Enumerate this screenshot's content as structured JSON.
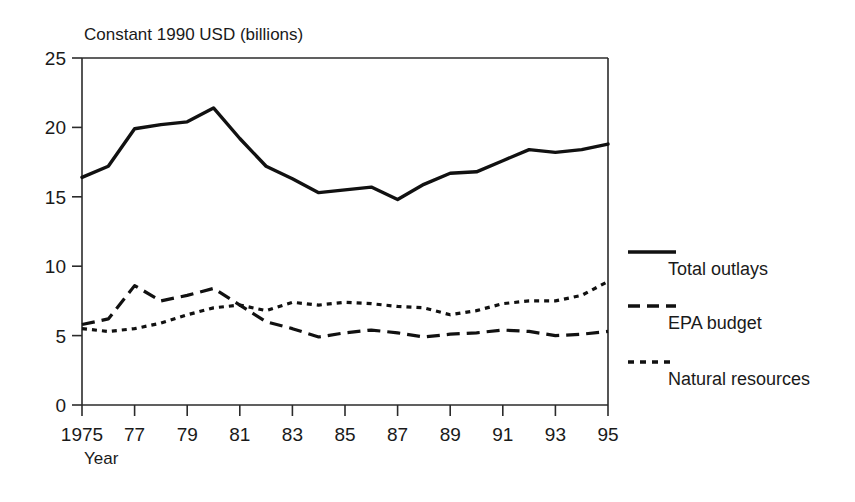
{
  "chart_data": {
    "type": "line",
    "title": "",
    "ylabel": "Constant 1990 USD (billions)",
    "xlabel": "Year",
    "xlim": [
      1975,
      1995
    ],
    "ylim": [
      0,
      25
    ],
    "yticks": [
      "0",
      "5",
      "10",
      "15",
      "20",
      "25"
    ],
    "ytick_values": [
      0,
      5,
      10,
      15,
      20,
      25
    ],
    "xticks": [
      "1975",
      "77",
      "79",
      "81",
      "83",
      "85",
      "87",
      "89",
      "91",
      "93",
      "95"
    ],
    "xtick_values": [
      1975,
      1977,
      1979,
      1981,
      1983,
      1985,
      1987,
      1989,
      1991,
      1993,
      1995
    ],
    "grid": false,
    "legend_position": "right",
    "x": [
      1975,
      1976,
      1977,
      1978,
      1979,
      1980,
      1981,
      1982,
      1983,
      1984,
      1985,
      1986,
      1987,
      1988,
      1989,
      1990,
      1991,
      1992,
      1993,
      1994,
      1995
    ],
    "series": [
      {
        "name": "Total outlays",
        "style": "solid",
        "values": [
          16.4,
          17.2,
          19.9,
          20.2,
          20.4,
          21.4,
          19.2,
          17.2,
          16.3,
          15.3,
          15.5,
          15.7,
          14.8,
          15.9,
          16.7,
          16.8,
          17.6,
          18.4,
          18.2,
          18.4,
          18.8
        ]
      },
      {
        "name": "EPA budget",
        "style": "dashed",
        "values": [
          5.8,
          6.2,
          8.6,
          7.5,
          7.9,
          8.4,
          7.2,
          6.0,
          5.5,
          4.9,
          5.2,
          5.4,
          5.2,
          4.9,
          5.1,
          5.2,
          5.4,
          5.3,
          5.0,
          5.1,
          5.3
        ]
      },
      {
        "name": "Natural resources",
        "style": "dotted",
        "values": [
          5.5,
          5.3,
          5.5,
          5.9,
          6.5,
          7.0,
          7.2,
          6.8,
          7.4,
          7.2,
          7.4,
          7.3,
          7.1,
          7.0,
          6.5,
          6.8,
          7.3,
          7.5,
          7.5,
          7.9,
          8.9
        ]
      }
    ]
  }
}
